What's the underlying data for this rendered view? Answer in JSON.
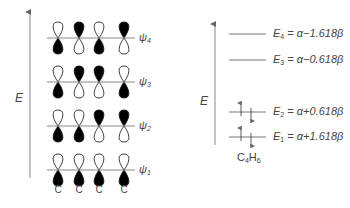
{
  "left_diagram": {
    "axis_label": "E",
    "atom_labels": [
      "C",
      "C",
      "C",
      "C"
    ],
    "orbitals": [
      {
        "name": "ψ",
        "sub": "4",
        "y": 38,
        "top_filled": [
          false,
          true,
          false,
          true
        ]
      },
      {
        "name": "ψ",
        "sub": "3",
        "y": 82,
        "top_filled": [
          false,
          true,
          true,
          false
        ]
      },
      {
        "name": "ψ",
        "sub": "2",
        "y": 126,
        "top_filled": [
          false,
          false,
          true,
          true
        ]
      },
      {
        "name": "ψ",
        "sub": "1",
        "y": 170,
        "top_filled": [
          false,
          false,
          false,
          false
        ]
      }
    ]
  },
  "right_diagram": {
    "axis_label": "E",
    "molecule": {
      "main": "C",
      "sub1": "4",
      "main2": "H",
      "sub2": "6"
    },
    "levels": [
      {
        "E": "E",
        "sub": "4",
        "expr": " = α−1.618β",
        "y": 34,
        "electrons": 0
      },
      {
        "E": "E",
        "sub": "3",
        "expr": " = α−0.618β",
        "y": 60,
        "electrons": 0
      },
      {
        "E": "E",
        "sub": "2",
        "expr": " = α+0.618β",
        "y": 112,
        "electrons": 2
      },
      {
        "E": "E",
        "sub": "1",
        "expr": " = α+1.618β",
        "y": 137,
        "electrons": 2
      }
    ]
  },
  "colors": {
    "line": "#777777",
    "lobe_fill": "#000000",
    "text": "#444444"
  }
}
